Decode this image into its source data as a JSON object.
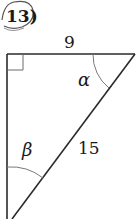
{
  "problem": {
    "number": "13)"
  },
  "triangle": {
    "side_top": "9",
    "hypotenuse": "15",
    "angle_top_right": "α",
    "angle_bottom": "β",
    "right_angle_marker": "top-left"
  },
  "colors": {
    "line": "#2a2a2a",
    "arc": "#6a6a6a",
    "background": "#ffffff"
  }
}
